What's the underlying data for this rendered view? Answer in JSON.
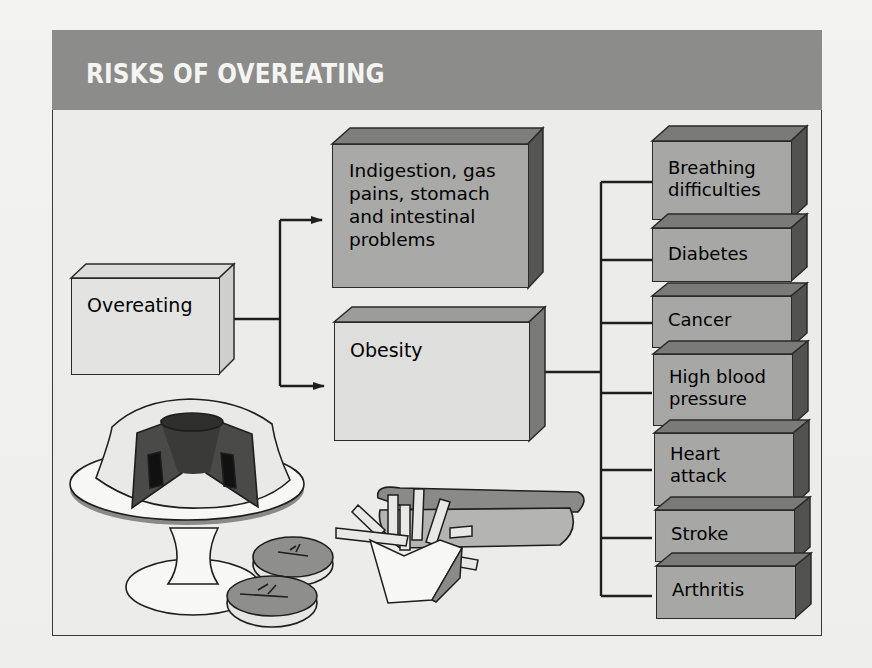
{
  "title": "RISKS OF OVEREATING",
  "colors": {
    "title_band": "#8c8c8a",
    "title_text": "#f4f4f2",
    "frame_bg": "#ececea",
    "light_box": "#e3e3e1",
    "mid_box": "#a9a9a7",
    "box_side_dark": "#5a5a58",
    "line": "#1e1e1e"
  },
  "diagram": {
    "root": {
      "id": "overeating",
      "label": "Overeating"
    },
    "effects": [
      {
        "id": "digestive",
        "label": "Indigestion, gas\npains, stomach\nand intestinal\nproblems"
      },
      {
        "id": "obesity",
        "label": "Obesity"
      }
    ],
    "obesity_risks": [
      {
        "id": "breathing",
        "label": "Breathing\ndifficulties"
      },
      {
        "id": "diabetes",
        "label": "Diabetes"
      },
      {
        "id": "cancer",
        "label": "Cancer"
      },
      {
        "id": "hbp",
        "label": "High blood\npressure"
      },
      {
        "id": "heart",
        "label": "Heart\nattack"
      },
      {
        "id": "stroke",
        "label": "Stroke"
      },
      {
        "id": "arthritis",
        "label": "Arthritis"
      }
    ],
    "edges": [
      {
        "from": "overeating",
        "to": "digestive",
        "arrow": true
      },
      {
        "from": "overeating",
        "to": "obesity",
        "arrow": true
      },
      {
        "from": "obesity",
        "to": "breathing",
        "arrow": false
      },
      {
        "from": "obesity",
        "to": "diabetes",
        "arrow": false
      },
      {
        "from": "obesity",
        "to": "cancer",
        "arrow": false
      },
      {
        "from": "obesity",
        "to": "hbp",
        "arrow": false
      },
      {
        "from": "obesity",
        "to": "heart",
        "arrow": false
      },
      {
        "from": "obesity",
        "to": "stroke",
        "arrow": false
      },
      {
        "from": "obesity",
        "to": "arthritis",
        "arrow": false
      }
    ]
  },
  "illustrations": [
    {
      "name": "bundt-cake-on-stand"
    },
    {
      "name": "glazed-donuts"
    },
    {
      "name": "french-fries"
    },
    {
      "name": "hot-dog"
    }
  ]
}
